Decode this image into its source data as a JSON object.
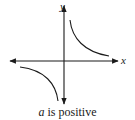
{
  "diagram": {
    "axes": {
      "x_label": "x",
      "y_label": "y"
    },
    "caption": {
      "variable": "a",
      "text": " is positive"
    },
    "branches": [
      {
        "quadrant": "I",
        "description": "upper-right branch"
      },
      {
        "quadrant": "III",
        "description": "lower-left branch"
      }
    ],
    "colors": {
      "stroke": "#1a1a1a",
      "background": "#ffffff"
    }
  }
}
